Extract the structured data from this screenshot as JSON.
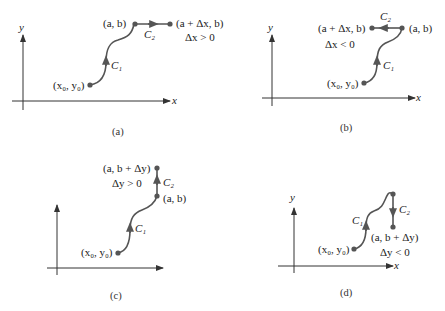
{
  "colors": {
    "curve": "#555555",
    "axis": "#333333",
    "text": "#222222",
    "background": "#ffffff"
  },
  "panels": [
    {
      "id": "a",
      "caption": "(a)",
      "axis_x": "x",
      "axis_y": "y",
      "start_label": "(x₀, y₀)",
      "corner_label": "(a, b)",
      "end_label": "(a + Δx, b)",
      "condition": "Δx > 0",
      "c1": "C₁",
      "c2": "C₂"
    },
    {
      "id": "b",
      "caption": "(b)",
      "axis_x": "x",
      "axis_y": "y",
      "start_label": "(x₀, y₀)",
      "corner_label": "(a, b)",
      "end_label": "(a + Δx, b)",
      "condition": "Δx < 0",
      "c1": "C₁",
      "c2": "C₂"
    },
    {
      "id": "c",
      "caption": "(c)",
      "axis_x": "",
      "axis_y": "",
      "start_label": "(x₀, y₀)",
      "corner_label": "(a, b)",
      "end_label": "(a, b + Δy)",
      "condition": "Δy > 0",
      "c1": "C₁",
      "c2": "C₂"
    },
    {
      "id": "d",
      "caption": "(d)",
      "axis_x": "x",
      "axis_y": "y",
      "start_label": "(x₀, y₀)",
      "corner_label": "",
      "end_label": "(a, b + Δy)",
      "condition": "Δy < 0",
      "c1": "C₁",
      "c2": "C₂"
    }
  ]
}
